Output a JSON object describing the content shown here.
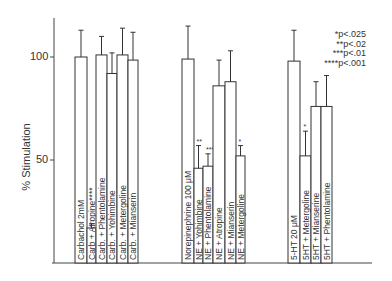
{
  "chart_data": {
    "type": "bar",
    "title": "",
    "xlabel": "",
    "ylabel": "% Stimulation",
    "ylim": [
      0,
      125
    ],
    "yticks": [
      50,
      100
    ],
    "grid": false,
    "legend_position": "top-right",
    "groups": [
      {
        "name": "Carbachol",
        "categories": [
          "Carbachol 2mM",
          "Carb + Atropine****",
          "Carb. + Phentolamine",
          "Carb. + Yohimbine",
          "Carb. + Metergoline",
          "Carb. + Mianserin"
        ],
        "values": [
          100,
          17,
          101,
          92,
          101,
          98.5
        ],
        "error_upper": [
          113,
          19,
          110,
          102,
          114,
          112
        ],
        "significance": [
          "",
          "****",
          "",
          "",
          "",
          ""
        ]
      },
      {
        "name": "Norepinephrine",
        "categories": [
          "Norepinephrine 100 μM",
          "NE + Yohimbine",
          "NE + Phentolamine",
          "NE + Atropine",
          "NE + Mianserin",
          "NE + Metergoline"
        ],
        "values": [
          99,
          46,
          47,
          86,
          88,
          52
        ],
        "error_upper": [
          115,
          57,
          53,
          98.5,
          103,
          57
        ],
        "significance": [
          "",
          "**",
          "***",
          "",
          "",
          "*"
        ]
      },
      {
        "name": "5-HT",
        "categories": [
          "5-HT 20 μM",
          "5HT + Metergoline",
          "5HT + Mianserine",
          "5HT + Phentolamine"
        ],
        "values": [
          98,
          52,
          76,
          76
        ],
        "error_upper": [
          113,
          64,
          88,
          91
        ],
        "significance": [
          "",
          "*",
          "",
          ""
        ]
      }
    ],
    "annotations": [
      "*p<.025",
      "**p<.02",
      "***p<.01",
      "****p<.001"
    ]
  },
  "axis": {
    "ylabel": "% Stimulation",
    "tick_100": "100",
    "tick_50": "50"
  },
  "legend": {
    "l1": "*p<.025",
    "l2": "**p<.02",
    "l3": "***p<.01",
    "l4": "****p<.001"
  }
}
